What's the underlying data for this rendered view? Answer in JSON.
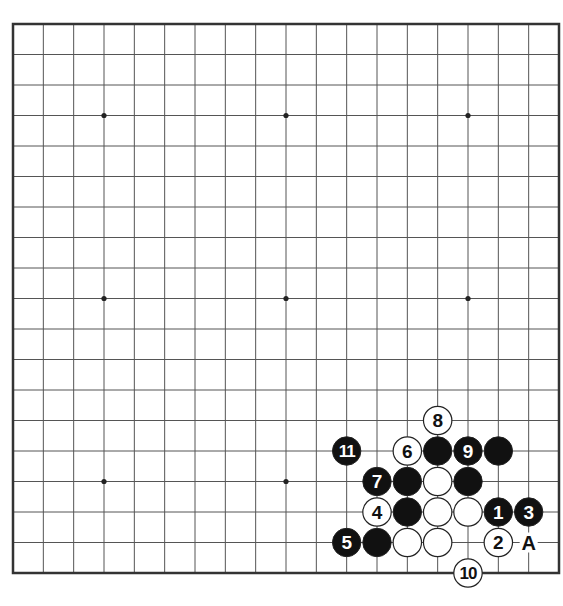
{
  "diagram": {
    "type": "go-board",
    "size": 19,
    "board": {
      "left": 13,
      "top": 24,
      "right": 559,
      "bottom": 573,
      "line_color": "#555555",
      "border_color": "#333333",
      "background": "#ffffff"
    },
    "star_points": [
      [
        3,
        3
      ],
      [
        9,
        3
      ],
      [
        15,
        3
      ],
      [
        3,
        9
      ],
      [
        9,
        9
      ],
      [
        15,
        9
      ],
      [
        3,
        15
      ],
      [
        9,
        15
      ],
      [
        15,
        15
      ]
    ],
    "stones": [
      {
        "col": 16,
        "row": 16,
        "color": "black",
        "label": "1"
      },
      {
        "col": 16,
        "row": 17,
        "color": "white",
        "label": "2"
      },
      {
        "col": 17,
        "row": 16,
        "color": "black",
        "label": "3"
      },
      {
        "col": 12,
        "row": 16,
        "color": "white",
        "label": "4"
      },
      {
        "col": 11,
        "row": 17,
        "color": "black",
        "label": "5"
      },
      {
        "col": 13,
        "row": 14,
        "color": "white",
        "label": "6"
      },
      {
        "col": 12,
        "row": 15,
        "color": "black",
        "label": "7"
      },
      {
        "col": 14,
        "row": 13,
        "color": "white",
        "label": "8"
      },
      {
        "col": 15,
        "row": 14,
        "color": "black",
        "label": "9"
      },
      {
        "col": 15,
        "row": 18,
        "color": "white",
        "label": "10"
      },
      {
        "col": 11,
        "row": 14,
        "color": "black",
        "label": "11"
      },
      {
        "col": 14,
        "row": 14,
        "color": "black",
        "label": ""
      },
      {
        "col": 16,
        "row": 14,
        "color": "black",
        "label": ""
      },
      {
        "col": 13,
        "row": 15,
        "color": "black",
        "label": ""
      },
      {
        "col": 14,
        "row": 15,
        "color": "white",
        "label": ""
      },
      {
        "col": 15,
        "row": 15,
        "color": "black",
        "label": ""
      },
      {
        "col": 13,
        "row": 16,
        "color": "black",
        "label": ""
      },
      {
        "col": 14,
        "row": 16,
        "color": "white",
        "label": ""
      },
      {
        "col": 15,
        "row": 16,
        "color": "white",
        "label": ""
      },
      {
        "col": 12,
        "row": 17,
        "color": "black",
        "label": ""
      },
      {
        "col": 13,
        "row": 17,
        "color": "white",
        "label": ""
      },
      {
        "col": 14,
        "row": 17,
        "color": "white",
        "label": ""
      }
    ],
    "markers": [
      {
        "col": 17,
        "row": 17,
        "label": "A"
      }
    ]
  }
}
